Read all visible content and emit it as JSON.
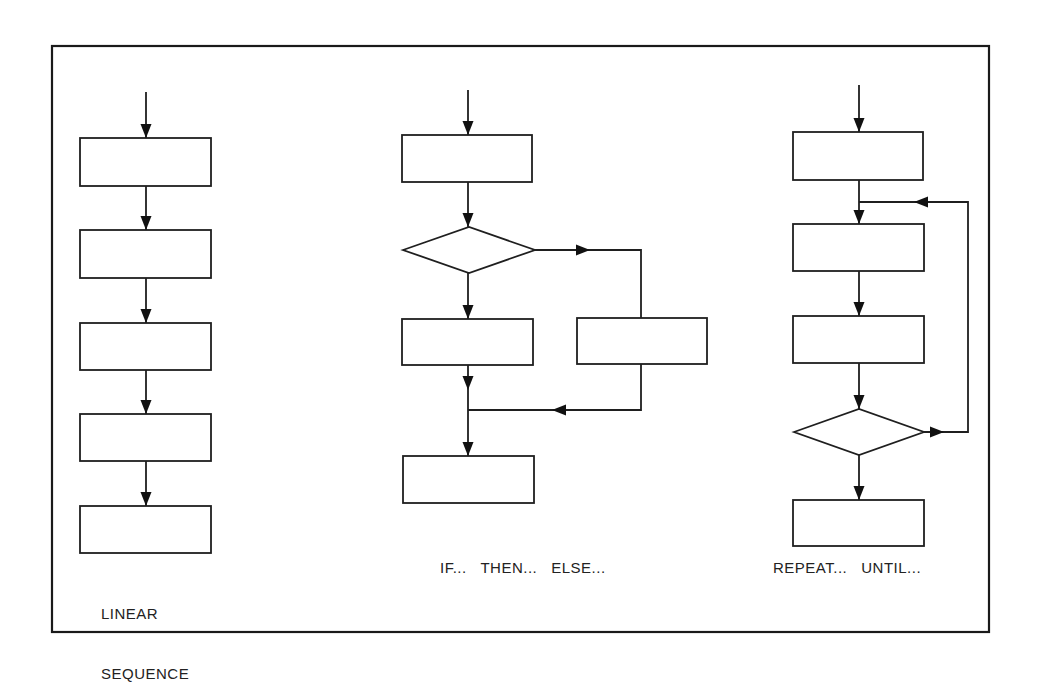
{
  "colors": {
    "stroke": "#1f1f1f",
    "background": "#ffffff"
  },
  "frame": {
    "x": 52,
    "y": 46,
    "x2": 989,
    "y2": 632
  },
  "labels": {
    "linear": {
      "line1": "LINEAR",
      "line2": "SEQUENCE",
      "x": 101,
      "y": 564
    },
    "if_then_else": {
      "text": "IF...   THEN...   ELSE...",
      "x": 440,
      "y": 558
    },
    "repeat_until": {
      "text": "REPEAT...   UNTIL...",
      "x": 773,
      "y": 558
    }
  },
  "linear_sequence": {
    "boxes": [
      {
        "x": 80,
        "y": 138,
        "w": 131,
        "h": 48
      },
      {
        "x": 80,
        "y": 230,
        "w": 131,
        "h": 48
      },
      {
        "x": 80,
        "y": 323,
        "w": 131,
        "h": 47
      },
      {
        "x": 80,
        "y": 414,
        "w": 131,
        "h": 47
      },
      {
        "x": 80,
        "y": 506,
        "w": 131,
        "h": 47
      }
    ],
    "arrows": [
      {
        "points": [
          [
            146,
            92
          ],
          [
            146,
            138
          ]
        ]
      },
      {
        "points": [
          [
            146,
            186
          ],
          [
            146,
            230
          ]
        ]
      },
      {
        "points": [
          [
            146,
            278
          ],
          [
            146,
            323
          ]
        ]
      },
      {
        "points": [
          [
            146,
            370
          ],
          [
            146,
            414
          ]
        ]
      },
      {
        "points": [
          [
            146,
            461
          ],
          [
            146,
            506
          ]
        ]
      }
    ]
  },
  "if_then_else": {
    "boxes": [
      {
        "x": 402,
        "y": 135,
        "w": 130,
        "h": 47
      },
      {
        "x": 402,
        "y": 319,
        "w": 131,
        "h": 46
      },
      {
        "x": 577,
        "y": 318,
        "w": 130,
        "h": 46
      },
      {
        "x": 403,
        "y": 456,
        "w": 131,
        "h": 47
      }
    ],
    "diamonds": [
      {
        "cx": 469,
        "cy": 250,
        "hw": 66,
        "hh": 23
      }
    ],
    "arrows": [
      {
        "points": [
          [
            468,
            90
          ],
          [
            468,
            135
          ]
        ]
      },
      {
        "points": [
          [
            468,
            182
          ],
          [
            468,
            227
          ]
        ]
      },
      {
        "points": [
          [
            468,
            273
          ],
          [
            468,
            319
          ]
        ]
      },
      {
        "points": [
          [
            535,
            250
          ],
          [
            641,
            250
          ],
          [
            641,
            318
          ]
        ],
        "head_at": [
          [
            590,
            250
          ],
          "right"
        ]
      },
      {
        "points": [
          [
            468,
            365
          ],
          [
            468,
            410
          ]
        ],
        "head_at": [
          [
            468,
            390
          ],
          "down"
        ]
      },
      {
        "points": [
          [
            641,
            364
          ],
          [
            641,
            410
          ],
          [
            468,
            410
          ]
        ],
        "head_at": [
          [
            552,
            410
          ],
          "left"
        ]
      },
      {
        "points": [
          [
            468,
            410
          ],
          [
            468,
            456
          ]
        ]
      }
    ]
  },
  "repeat_until": {
    "boxes": [
      {
        "x": 793,
        "y": 132,
        "w": 130,
        "h": 48
      },
      {
        "x": 793,
        "y": 224,
        "w": 131,
        "h": 47
      },
      {
        "x": 793,
        "y": 316,
        "w": 131,
        "h": 47
      },
      {
        "x": 793,
        "y": 500,
        "w": 131,
        "h": 46
      }
    ],
    "diamonds": [
      {
        "cx": 859,
        "cy": 432,
        "hw": 65,
        "hh": 23
      }
    ],
    "arrows": [
      {
        "points": [
          [
            859,
            85
          ],
          [
            859,
            132
          ]
        ]
      },
      {
        "points": [
          [
            859,
            180
          ],
          [
            859,
            224
          ]
        ]
      },
      {
        "points": [
          [
            859,
            271
          ],
          [
            859,
            316
          ]
        ]
      },
      {
        "points": [
          [
            859,
            363
          ],
          [
            859,
            409
          ]
        ]
      },
      {
        "points": [
          [
            859,
            455
          ],
          [
            859,
            500
          ]
        ]
      },
      {
        "points": [
          [
            924,
            432
          ],
          [
            968,
            432
          ],
          [
            968,
            202
          ],
          [
            859,
            202
          ]
        ],
        "head_at_multi": [
          [
            [
              944,
              432
            ],
            "right"
          ],
          [
            [
              914,
              202
            ],
            "left"
          ]
        ]
      }
    ]
  }
}
